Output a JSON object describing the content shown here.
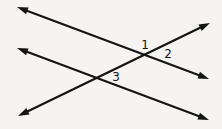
{
  "figure": {
    "type": "geometry-diagram",
    "background_color": "#f5f4f2",
    "stroke_color": "#141414",
    "label_color": "#141414",
    "stroke_width": 2.1,
    "width": 222,
    "height": 129
  },
  "lines": [
    {
      "id": "line-a",
      "name": "upper-line",
      "description": "Line from upper-left arrowhead descending to the right-middle arrowhead, passing through intersection 1",
      "arrowheads": "both",
      "x1": 17,
      "y1": 7,
      "x2": 209,
      "y2": 79
    },
    {
      "id": "line-b",
      "name": "lower-line",
      "description": "Line from left-middle arrowhead descending to the lower-right arrowhead, passing through intersection 3",
      "arrowheads": "both",
      "x1": 17,
      "y1": 48,
      "x2": 209,
      "y2": 120
    },
    {
      "id": "line-c",
      "name": "transversal",
      "description": "Transversal from lower-left arrowhead rising to the upper-right arrowhead, crossing both lines",
      "arrowheads": "both",
      "x1": 18,
      "y1": 116,
      "x2": 210,
      "y2": 23
    }
  ],
  "arrowheads": [
    {
      "id": "arrow-upper-left",
      "name": "arrowhead-upper-left",
      "x": 17,
      "y": 7,
      "direction": "up-left"
    },
    {
      "id": "arrow-right-middle",
      "name": "arrowhead-right-middle",
      "x": 209,
      "y": 79,
      "direction": "down-right"
    },
    {
      "id": "arrow-left-middle",
      "name": "arrowhead-left-middle",
      "x": 17,
      "y": 48,
      "direction": "up-left"
    },
    {
      "id": "arrow-lower-right",
      "name": "arrowhead-lower-right",
      "x": 209,
      "y": 120,
      "direction": "down-right"
    },
    {
      "id": "arrow-lower-left",
      "name": "arrowhead-lower-left",
      "x": 18,
      "y": 116,
      "direction": "down-left"
    },
    {
      "id": "arrow-upper-right",
      "name": "arrowhead-upper-right",
      "x": 210,
      "y": 23,
      "direction": "up-right"
    }
  ],
  "intersections": [
    {
      "id": "intersection-top",
      "name": "intersection-upper-line-transversal",
      "x": 146,
      "y": 54,
      "lines": [
        "line-a",
        "line-c"
      ]
    },
    {
      "id": "intersection-bottom",
      "name": "intersection-lower-line-transversal",
      "x": 95,
      "y": 78,
      "lines": [
        "line-b",
        "line-c"
      ]
    }
  ],
  "angle_labels": [
    {
      "id": "angle-1",
      "name": "angle-label-1",
      "text": "1",
      "x": 145,
      "y": 45,
      "at_intersection": "intersection-top",
      "position": "above-left of intersection"
    },
    {
      "id": "angle-2",
      "name": "angle-label-2",
      "text": "2",
      "x": 168,
      "y": 54,
      "at_intersection": "intersection-top",
      "position": "right of intersection"
    },
    {
      "id": "angle-3",
      "name": "angle-label-3",
      "text": "3",
      "x": 116,
      "y": 77,
      "at_intersection": "intersection-bottom",
      "position": "right of intersection"
    }
  ]
}
